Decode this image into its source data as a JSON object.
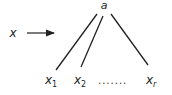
{
  "diagram": {
    "root": {
      "label": "a",
      "x": 104,
      "y": 9
    },
    "input": {
      "label": "x",
      "x": 13,
      "y": 37
    },
    "arrow": {
      "x1": 27,
      "y1": 33,
      "x2": 54,
      "y2": 33
    },
    "edges": [
      {
        "x1": 97,
        "y1": 14,
        "x2": 56,
        "y2": 70
      },
      {
        "x1": 103,
        "y1": 16,
        "x2": 81,
        "y2": 67
      },
      {
        "x1": 111,
        "y1": 14,
        "x2": 148,
        "y2": 65
      }
    ],
    "leaves": [
      {
        "label": "x",
        "sub": "1",
        "x": 45,
        "y": 84
      },
      {
        "label": "x",
        "sub": "2",
        "x": 74,
        "y": 84
      },
      {
        "label": "x",
        "sub": "r",
        "x": 146,
        "y": 84
      }
    ],
    "ellipsis": {
      "text": ".......",
      "x": 98,
      "y": 84
    },
    "colors": {
      "stroke": "#222222",
      "background": "#ffffff"
    }
  }
}
